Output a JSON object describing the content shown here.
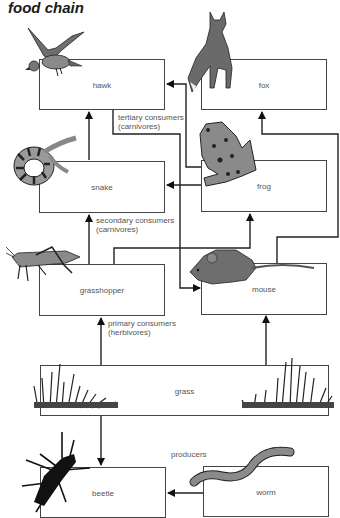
{
  "title": "food chain",
  "organisms": {
    "hawk": "hawk",
    "fox": "fox",
    "snake": "snake",
    "frog": "frog",
    "grasshopper": "grasshopper",
    "mouse": "mouse",
    "grass": "grass",
    "beetle": "beetle",
    "worm": "worm"
  },
  "levels": {
    "tertiary": "tertiary consumers",
    "tertiary_sub": "(carnivores)",
    "secondary": "secondary consumers",
    "secondary_sub": "(carnivores)",
    "primary": "primary consumers",
    "primary_sub": "(herbivores)",
    "producers": "producers"
  },
  "arrows": [
    {
      "from": "snake",
      "to": "hawk"
    },
    {
      "from": "frog",
      "to": "hawk"
    },
    {
      "from": "hawk",
      "to": "mouse"
    },
    {
      "from": "mouse",
      "to": "fox"
    },
    {
      "from": "frog",
      "to": "snake"
    },
    {
      "from": "grasshopper",
      "to": "snake"
    },
    {
      "from": "grasshopper",
      "to": "frog"
    },
    {
      "from": "grass",
      "to": "grasshopper"
    },
    {
      "from": "grass",
      "to": "mouse"
    },
    {
      "from": "grass",
      "to": "beetle"
    },
    {
      "from": "worm",
      "to": "beetle"
    }
  ],
  "colors": {
    "line": "#222222",
    "box_border": "#444444",
    "label": "#555555"
  }
}
